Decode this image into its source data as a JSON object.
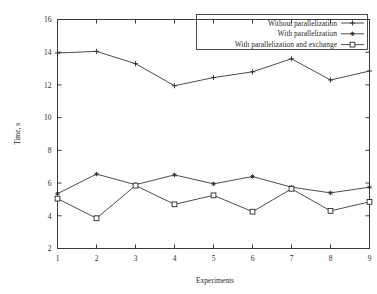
{
  "chart_data": {
    "type": "line",
    "title": "",
    "xlabel": "Experiments",
    "ylabel": "Time, s",
    "categories": [
      1,
      2,
      3,
      4,
      5,
      6,
      7,
      8,
      9
    ],
    "x": [
      1,
      2,
      3,
      4,
      5,
      6,
      7,
      8,
      9
    ],
    "xlim": [
      1,
      9
    ],
    "ylim": [
      2,
      16
    ],
    "xticks": [
      "1",
      "2",
      "3",
      "4",
      "5",
      "6",
      "7",
      "8",
      "9"
    ],
    "yticks": [
      "2",
      "4",
      "6",
      "8",
      "10",
      "12",
      "14",
      "16"
    ],
    "grid": false,
    "legend_position": "top-right",
    "series": [
      {
        "name": "Without parallelization",
        "marker": "plus",
        "values": [
          13.95,
          14.05,
          13.3,
          11.95,
          12.45,
          12.8,
          13.6,
          12.3,
          12.85
        ]
      },
      {
        "name": "With parallelization",
        "marker": "asterisk",
        "values": [
          5.35,
          6.55,
          5.9,
          6.5,
          5.95,
          6.4,
          5.75,
          5.4,
          5.75
        ]
      },
      {
        "name": "With parallelization and exchange",
        "marker": "open-square",
        "values": [
          5.05,
          3.85,
          5.85,
          4.7,
          5.25,
          4.25,
          5.65,
          4.3,
          4.85
        ]
      }
    ]
  },
  "legend": {
    "entries": [
      "Without parallelization",
      "With parallelization",
      "With parallelization and exchange"
    ]
  },
  "colors": {
    "line": "#3a3a3a",
    "text": "#2b2b2b",
    "background": "#ffffff"
  }
}
